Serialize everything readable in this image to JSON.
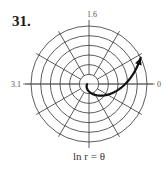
{
  "problem_number": "31.",
  "chart_data": {
    "type": "line",
    "coordinate_system": "polar",
    "title": "",
    "caption": "ln r = θ",
    "equation": "ln r = θ",
    "grid": {
      "rings": 6,
      "spokes": 12,
      "spoke_step_degrees": 30
    },
    "r_max": 1.6,
    "axis_labels": {
      "right": "0",
      "top": "1.6",
      "left": "3.1"
    },
    "series": [
      {
        "name": "ln r = θ",
        "theta_range": [
          -3.0,
          0.47
        ],
        "r_function": "exp(theta)",
        "arrow_at_end": true
      }
    ]
  }
}
